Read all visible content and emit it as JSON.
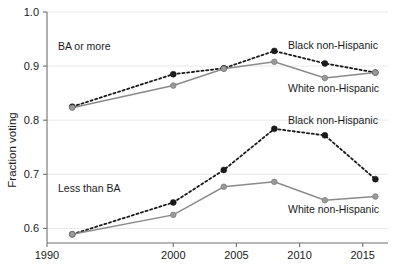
{
  "chart_data": {
    "type": "line",
    "title": "",
    "xlabel": "",
    "ylabel": "Fraction voting",
    "xlim": [
      1990,
      2017
    ],
    "ylim": [
      0.573,
      1.0
    ],
    "grid": true,
    "legend_position": "inline-annotations",
    "x_ticks": [
      1990,
      2000,
      2005,
      2010,
      2015
    ],
    "x_tick_labels": [
      "1990",
      "2000",
      "2005",
      "2010",
      "2015"
    ],
    "y_ticks": [
      0.6,
      0.7,
      0.8,
      0.9,
      1.0
    ],
    "y_tick_labels": [
      "0.6",
      "0.7",
      "0.8",
      "0.9",
      "1.0"
    ],
    "x": [
      1992,
      2000,
      2004,
      2008,
      2012,
      2016
    ],
    "panels": [
      {
        "name": "BA or more",
        "label": "BA or more",
        "series": [
          {
            "name": "Black non-Hispanic",
            "style": "dotted",
            "marker": "black",
            "values": [
              0.825,
              0.885,
              0.896,
              0.928,
              0.905,
              0.888
            ]
          },
          {
            "name": "White non-Hispanic",
            "style": "solid",
            "marker": "grey",
            "values": [
              0.823,
              0.864,
              0.895,
              0.908,
              0.878,
              0.888
            ]
          }
        ]
      },
      {
        "name": "Less than BA",
        "label": "Less than BA",
        "series": [
          {
            "name": "Black non-Hispanic",
            "style": "dotted",
            "marker": "black",
            "values": [
              0.589,
              0.648,
              0.708,
              0.784,
              0.772,
              0.691
            ]
          },
          {
            "name": "White non-Hispanic",
            "style": "solid",
            "marker": "grey",
            "values": [
              0.589,
              0.625,
              0.677,
              0.686,
              0.652,
              0.659
            ]
          }
        ]
      }
    ],
    "annotations": [
      {
        "id": "ba-group-label",
        "text": "BA or more",
        "x_px": 58,
        "y_px": 50,
        "anchor": "start"
      },
      {
        "id": "ba-black-label",
        "text": "Black non-Hispanic",
        "x_px": 288,
        "y_px": 49,
        "anchor": "start"
      },
      {
        "id": "ba-white-label",
        "text": "White non-Hispanic",
        "x_px": 288,
        "y_px": 92,
        "anchor": "start"
      },
      {
        "id": "lessba-group-label",
        "text": "Less than BA",
        "x_px": 58,
        "y_px": 192,
        "anchor": "start"
      },
      {
        "id": "lessba-black-label",
        "text": "Black non-Hispanic",
        "x_px": 288,
        "y_px": 124,
        "anchor": "start"
      },
      {
        "id": "lessba-white-label",
        "text": "White non-Hispanic",
        "x_px": 288,
        "y_px": 213,
        "anchor": "start"
      }
    ],
    "colors": {
      "black_series": "#1a1a1a",
      "white_series": "#8a8a8a",
      "grid": "#e9e9e9",
      "axis": "#6f6f6f",
      "text": "#1a1a1a",
      "background": "#ffffff"
    }
  }
}
